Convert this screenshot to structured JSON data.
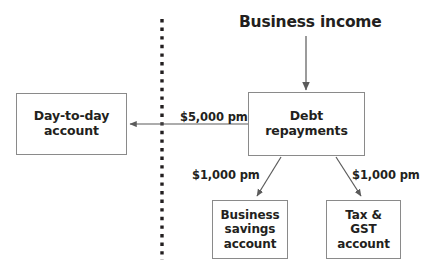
{
  "diagram": {
    "title": "Business income",
    "nodes": [
      {
        "id": "day-to-day",
        "label": "Day-to-day\naccount"
      },
      {
        "id": "debt-repayments",
        "label": "Debt\nrepayments"
      },
      {
        "id": "business-savings",
        "label": "Business\nsavings\naccount"
      },
      {
        "id": "tax-gst",
        "label": "Tax &\nGST\naccount"
      }
    ],
    "edges": [
      {
        "id": "income-to-debt",
        "label": "",
        "from": "business-income",
        "to": "debt-repayments"
      },
      {
        "id": "debt-to-day-to-day",
        "label": "$5,000 pm",
        "from": "debt-repayments",
        "to": "day-to-day"
      },
      {
        "id": "debt-to-business-savings",
        "label": "$1,000 pm",
        "from": "debt-repayments",
        "to": "business-savings"
      },
      {
        "id": "debt-to-tax-gst",
        "label": "$1,000 pm",
        "from": "debt-repayments",
        "to": "tax-gst"
      }
    ],
    "divider": {
      "name": "dashed-separator",
      "orientation": "vertical"
    },
    "colors": {
      "text": "#231f20",
      "border": "#8a8a8a",
      "arrow": "#5b5b5b",
      "background": "#ffffff"
    }
  }
}
